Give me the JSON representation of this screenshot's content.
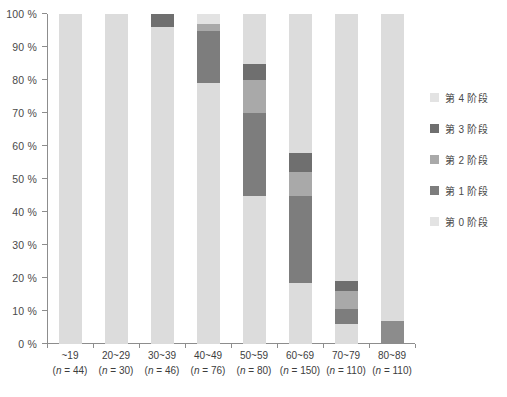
{
  "chart_data": {
    "type": "bar",
    "subtype": "stacked-percentage",
    "title": "",
    "xlabel": "",
    "ylabel": "",
    "ylim": [
      0,
      100
    ],
    "yticks": [
      "0 %",
      "10 %",
      "20 %",
      "30 %",
      "40 %",
      "50 %",
      "60 %",
      "70 %",
      "80 %",
      "90 %",
      "100 %"
    ],
    "ytick_values": [
      0,
      10,
      20,
      30,
      40,
      50,
      60,
      70,
      80,
      90,
      100
    ],
    "grid": false,
    "legend_position": "right",
    "categories": [
      "~19",
      "20~29",
      "30~39",
      "40~49",
      "50~59",
      "60~69",
      "70~79",
      "80~89"
    ],
    "group_sizes": [
      44,
      30,
      46,
      76,
      80,
      150,
      110,
      110
    ],
    "category_sublabels": [
      "(n = 44)",
      "(n = 30)",
      "(n = 46)",
      "(n = 76)",
      "(n = 80)",
      "(n = 150)",
      "(n = 110)",
      "(n = 110)"
    ],
    "series": [
      {
        "name": "第 4 阶段",
        "color": "#e3e3e3",
        "values": [
          0,
          0,
          0,
          3,
          0,
          0,
          0,
          0
        ]
      },
      {
        "name": "第 3 阶段",
        "color": "#6f6f6f",
        "values": [
          0,
          0,
          4,
          0,
          5,
          6,
          3,
          0
        ]
      },
      {
        "name": "第 2 阶段",
        "color": "#a9a9a9",
        "values": [
          0,
          0,
          0,
          2,
          10,
          7,
          5.5,
          0
        ]
      },
      {
        "name": "第 1 阶段",
        "color": "#7d7d7d",
        "values": [
          0,
          0,
          0,
          16,
          25,
          26.5,
          4.5,
          7
        ]
      },
      {
        "name": "第 0 阶段",
        "color": "#dcdcdc",
        "values": [
          100,
          100,
          96,
          79,
          60,
          60.5,
          87,
          93
        ]
      }
    ],
    "stack_order_top_to_bottom": [
      "第 4 阶段",
      "第 3 阶段",
      "第 2 阶段",
      "第 1 阶段",
      "第 0 阶段"
    ],
    "bars": [
      {
        "category": "~19",
        "segments": [
          {
            "series": "第 0 阶段",
            "from": 0,
            "to": 100,
            "color": "#dcdcdc"
          }
        ]
      },
      {
        "category": "20~29",
        "segments": [
          {
            "series": "第 0 阶段",
            "from": 0,
            "to": 100,
            "color": "#dcdcdc"
          }
        ]
      },
      {
        "category": "30~39",
        "segments": [
          {
            "series": "第 0 阶段",
            "from": 0,
            "to": 96,
            "color": "#dcdcdc"
          },
          {
            "series": "第 3 阶段",
            "from": 96,
            "to": 100,
            "color": "#6f6f6f"
          }
        ]
      },
      {
        "category": "40~49",
        "segments": [
          {
            "series": "第 0 阶段",
            "from": 0,
            "to": 79,
            "color": "#dcdcdc"
          },
          {
            "series": "第 1 阶段",
            "from": 79,
            "to": 95,
            "color": "#7d7d7d"
          },
          {
            "series": "第 2 阶段",
            "from": 95,
            "to": 97,
            "color": "#a9a9a9"
          },
          {
            "series": "第 4 阶段",
            "from": 97,
            "to": 100,
            "color": "#e3e3e3"
          }
        ]
      },
      {
        "category": "50~59",
        "segments": [
          {
            "series": "第 0 阶段",
            "from": 0,
            "to": 45,
            "color": "#dcdcdc"
          },
          {
            "series": "第 1 阶段",
            "from": 45,
            "to": 70,
            "color": "#7d7d7d"
          },
          {
            "series": "第 2 阶段",
            "from": 70,
            "to": 80,
            "color": "#a9a9a9"
          },
          {
            "series": "第 3 阶段",
            "from": 80,
            "to": 85,
            "color": "#6f6f6f"
          },
          {
            "series": "第 4 阶段",
            "from": 85,
            "to": 100,
            "color": "#dcdcdc"
          }
        ]
      },
      {
        "category": "60~69",
        "segments": [
          {
            "series": "第 0 阶段",
            "from": 0,
            "to": 18.5,
            "color": "#dcdcdc"
          },
          {
            "series": "第 1 阶段",
            "from": 18.5,
            "to": 45,
            "color": "#7d7d7d"
          },
          {
            "series": "第 2 阶段",
            "from": 45,
            "to": 52,
            "color": "#a9a9a9"
          },
          {
            "series": "第 3 阶段",
            "from": 52,
            "to": 58,
            "color": "#6f6f6f"
          },
          {
            "series": "第 4 阶段",
            "from": 58,
            "to": 100,
            "color": "#dcdcdc"
          }
        ]
      },
      {
        "category": "70~79",
        "segments": [
          {
            "series": "第 0 阶段",
            "from": 0,
            "to": 6,
            "color": "#dcdcdc"
          },
          {
            "series": "第 1 阶段",
            "from": 6,
            "to": 10.5,
            "color": "#7d7d7d"
          },
          {
            "series": "第 2 阶段",
            "from": 10.5,
            "to": 16,
            "color": "#a9a9a9"
          },
          {
            "series": "第 3 阶段",
            "from": 16,
            "to": 19,
            "color": "#6f6f6f"
          },
          {
            "series": "第 4 阶段",
            "from": 19,
            "to": 100,
            "color": "#dcdcdc"
          }
        ]
      },
      {
        "category": "80~89",
        "segments": [
          {
            "series": "第 1 阶段",
            "from": 0,
            "to": 7,
            "color": "#8c8c8c"
          },
          {
            "series": "第 4 阶段",
            "from": 7,
            "to": 100,
            "color": "#dcdcdc"
          }
        ]
      }
    ]
  },
  "legend": {
    "items": [
      {
        "label": "第 4 阶段",
        "color": "#e3e3e3"
      },
      {
        "label": "第 3 阶段",
        "color": "#6f6f6f"
      },
      {
        "label": "第 2 阶段",
        "color": "#a9a9a9"
      },
      {
        "label": "第 1 阶段",
        "color": "#7d7d7d"
      },
      {
        "label": "第 0 阶段",
        "color": "#e3e3e3"
      }
    ]
  }
}
